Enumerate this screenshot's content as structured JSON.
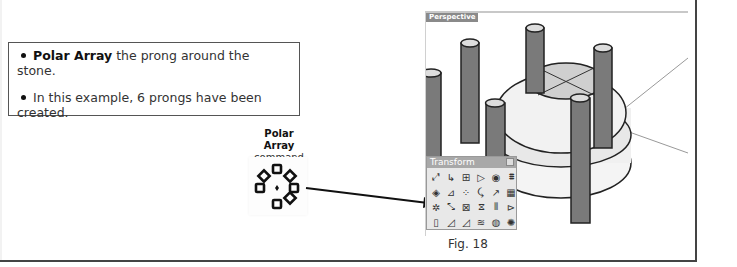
{
  "note": {
    "items": [
      {
        "bold": "Polar Array",
        "text": " the prong around the stone."
      },
      {
        "bold": "",
        "text": "In this example, 6 prongs have been created."
      }
    ]
  },
  "command": {
    "name": "Polar Array",
    "label": "command",
    "icon": "polar-array-icon"
  },
  "viewport": {
    "label": "Perspective",
    "prong_count": 6
  },
  "palette": {
    "title": "Transform",
    "tools": [
      "move",
      "copy",
      "rotate",
      "scale",
      "scale-3d",
      "mirror",
      "orient",
      "set-points",
      "align",
      "bend",
      "twist",
      "array",
      "polar-array",
      "flow",
      "cage-edit",
      "stretch",
      "taper",
      "shear",
      "orient-on-surface",
      "rotate-3d",
      "project",
      "smash",
      "remap",
      "splop"
    ],
    "tool_glyphs": [
      "⤢",
      "↳",
      "⊞",
      "▷",
      "◉",
      "⩩",
      "◈",
      "⊿",
      "⁘",
      "⤹",
      "↗",
      "▦",
      "✲",
      "⤡",
      "⊠",
      "⧖",
      "⫴",
      "⊳",
      "▯",
      "◿",
      "◿",
      "≋",
      "◍",
      "✺"
    ],
    "highlighted_tool": "polar-array"
  },
  "caption": "Fig. 18"
}
